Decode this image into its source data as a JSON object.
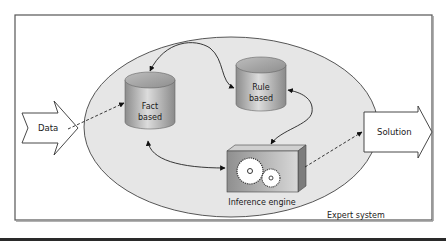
{
  "diagram": {
    "title": "Expert system",
    "nodes": {
      "data": {
        "label": "Data",
        "shape": "notched-arrow"
      },
      "fact_db": {
        "label_line1": "Fact",
        "label_line2": "based",
        "shape": "cylinder"
      },
      "rule_db": {
        "label_line1": "Rule",
        "label_line2": "based",
        "shape": "cylinder"
      },
      "inference": {
        "label": "Inference engine",
        "shape": "box-with-gears"
      },
      "solution": {
        "label": "Solution",
        "shape": "arrow"
      }
    },
    "edges": [
      {
        "from": "data",
        "to": "fact_db",
        "style": "dashed",
        "direction": "forward"
      },
      {
        "from": "fact_db",
        "to": "rule_db",
        "style": "solid",
        "direction": "both"
      },
      {
        "from": "fact_db",
        "to": "inference",
        "style": "solid",
        "direction": "both"
      },
      {
        "from": "inference",
        "to": "rule_db",
        "style": "solid",
        "direction": "both"
      },
      {
        "from": "inference",
        "to": "solution",
        "style": "dashed",
        "direction": "forward"
      }
    ],
    "colors": {
      "ellipse_fill": "#e6e6e6",
      "stroke": "#333333",
      "cylinder_light": "#d9d9d9",
      "cylinder_dark": "#8c8c8c",
      "box_front": "#9a9a9a",
      "box_top": "#cfcfcf",
      "gear": "#ffffff"
    }
  }
}
